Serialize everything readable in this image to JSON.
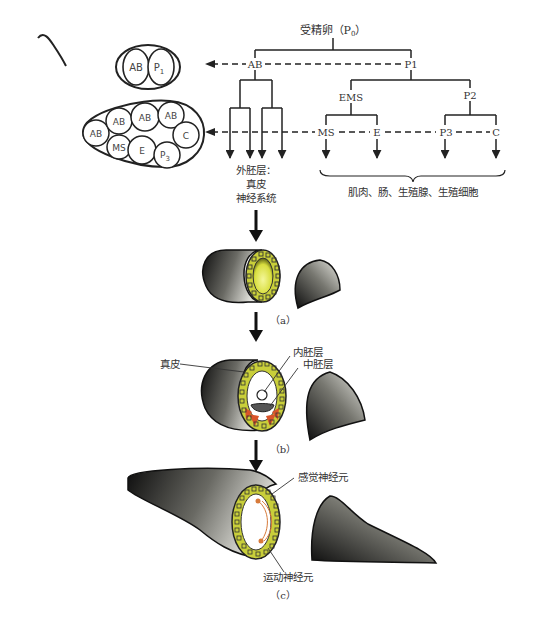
{
  "tree": {
    "root_label": "受精卵（P",
    "root_sub": "0",
    "root_close": "）",
    "nodes": {
      "ab": "AB",
      "p1": "P1",
      "ems": "EMS",
      "p2": "P2",
      "ms": "MS",
      "e": "E",
      "p3": "P3",
      "c": "C"
    },
    "ectoderm_label_line1": "外胚层：",
    "ectoderm_label_line2": "真皮",
    "ectoderm_label_line3": "神经系统",
    "brace_label": "肌肉、肠、生殖腺、生殖细胞"
  },
  "embryo_2cell": {
    "cells": [
      "AB",
      "P",
      "1"
    ]
  },
  "embryo_8cell": {
    "cells": [
      "AB",
      "AB",
      "AB",
      "AB",
      "MS",
      "E",
      "P",
      "3",
      "C"
    ]
  },
  "stages": {
    "a": {
      "caption": "（a）"
    },
    "b": {
      "caption": "（b）",
      "label_dermis": "真皮",
      "label_endoderm": "内胚层",
      "label_mesoderm": "中胚层"
    },
    "c": {
      "caption": "（c）",
      "label_sensory": "感觉神经元",
      "label_motor": "运动神经元"
    }
  },
  "colors": {
    "line": "#222222",
    "cell_ring": "#c9cf3a",
    "cell_inner": "#eef27a",
    "body_dark": "#1a1a1a",
    "body_light": "#d8d8d2",
    "mesoderm": "#d9542a",
    "neuron": "#d77a3a"
  }
}
